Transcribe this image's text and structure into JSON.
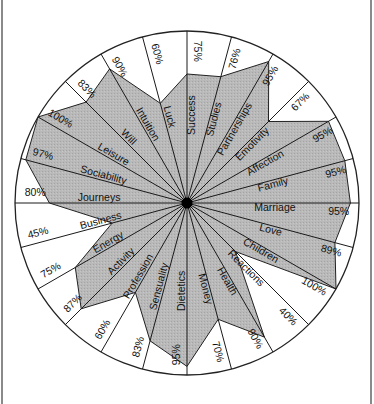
{
  "chart_data": {
    "type": "radar",
    "title": "",
    "subtitle": "",
    "axis_direction": "clockwise from top",
    "angle_step_deg": 15,
    "max_value": 100,
    "unit": "%",
    "grid": false,
    "legend": null,
    "categories": [
      "Success",
      "Studies",
      "Partnerships",
      "Emotivity",
      "Affection",
      "Family",
      "Marriage",
      "Love",
      "Children",
      "Reactions",
      "Health",
      "Money",
      "Dietetics",
      "Sensuality",
      "Profession",
      "Activity",
      "Energy",
      "Business",
      "Journeys",
      "Sociability",
      "Leisure",
      "Will",
      "Intuition",
      "Luck"
    ],
    "values": [
      75,
      76,
      95,
      67,
      95,
      95,
      95,
      89,
      100,
      40,
      90,
      70,
      95,
      83,
      60,
      87,
      75,
      45,
      80,
      97,
      100,
      83,
      90,
      60
    ],
    "value_labels": [
      "75%",
      "76%",
      "95%",
      "67%",
      "95%",
      "95%",
      "95%",
      "89%",
      "100%",
      "40%",
      "90%",
      "70%",
      "95%",
      "83%",
      "60%",
      "87%",
      "75%",
      "45%",
      "80%",
      "97%",
      "100%",
      "83%",
      "90%",
      "60%"
    ]
  },
  "colors": {
    "fill": "#b4b4b4",
    "line": "#1a1a1a",
    "center": "#000000",
    "background": "#ffffff",
    "frame": "#8a8a8a"
  }
}
